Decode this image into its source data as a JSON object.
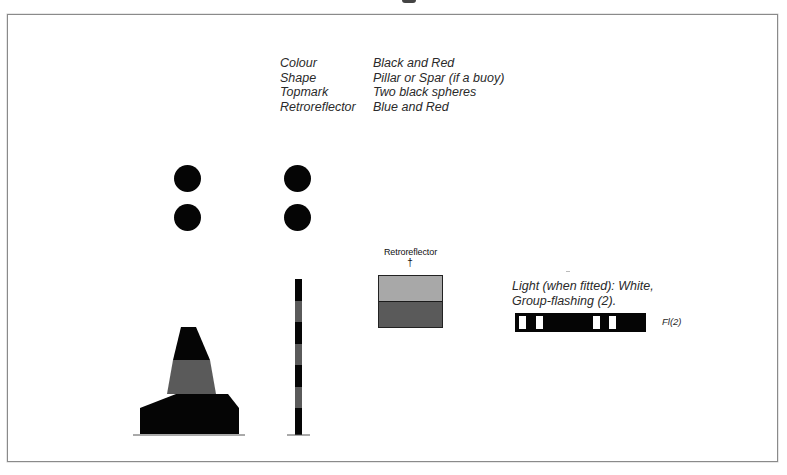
{
  "figure": {
    "properties": [
      {
        "key": "Colour",
        "value": "Black and Red"
      },
      {
        "key": "Shape",
        "value": "Pillar or Spar (if a buoy)"
      },
      {
        "key": "Topmark",
        "value": "Two black spheres"
      },
      {
        "key": "Retroreflector",
        "value": "Blue and Red"
      }
    ],
    "retroreflector": {
      "label": "Retroreflector",
      "arrow": "†",
      "top_color": "#a8a8a8",
      "bottom_color": "#5a5a5a"
    },
    "light": {
      "line1": "Light (when fitted): White,",
      "line2": "Group-flashing (2).",
      "code": "Fl(2)"
    },
    "colors": {
      "black": "#050505",
      "red_band": "#5a5a5a",
      "frame_border": "#8a8a8a"
    }
  }
}
